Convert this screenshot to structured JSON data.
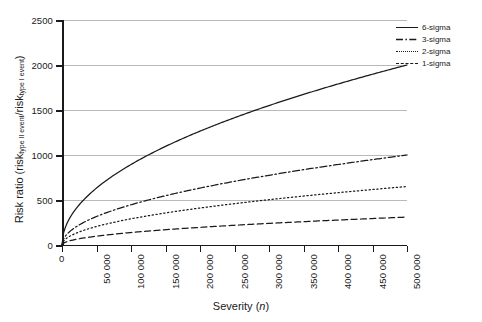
{
  "chart_data": {
    "type": "line",
    "title": "",
    "xlabel": "Severity (n)",
    "ylabel": "Risk ratio (risk_type II event / risk_type I event)",
    "ylabel_parts": {
      "prefix": "Risk ratio (risk",
      "sub1": "type II event",
      "mid": "/risk",
      "sub2": "type I event",
      "suffix": ")"
    },
    "xlabel_parts": {
      "prefix": "Severity (",
      "italic": "n",
      "suffix": ")"
    },
    "xlim": [
      0,
      500000
    ],
    "ylim": [
      0,
      2500
    ],
    "grid": true,
    "legend_position": "top-right",
    "xticks": [
      0,
      50000,
      100000,
      150000,
      200000,
      250000,
      300000,
      350000,
      400000,
      450000,
      500000
    ],
    "xticklabels": [
      "0",
      "50 000",
      "100 000",
      "150 000",
      "200 000",
      "250 000",
      "300 000",
      "350 000",
      "400 000",
      "450 000",
      "500 000"
    ],
    "yticks": [
      0,
      500,
      1000,
      1500,
      2000,
      2500
    ],
    "yticklabels": [
      "0",
      "500",
      "1000",
      "1500",
      "2000",
      "2500"
    ],
    "x": [
      0,
      5000,
      10000,
      20000,
      30000,
      50000,
      75000,
      100000,
      125000,
      150000,
      175000,
      200000,
      225000,
      250000,
      275000,
      300000,
      325000,
      350000,
      375000,
      400000,
      425000,
      450000,
      475000,
      500000
    ],
    "series": [
      {
        "name": "6-sigma",
        "style": "solid",
        "color": "#1a1a1a",
        "coefficient": 2.8284,
        "values": [
          0,
          200,
          283,
          400,
          490,
          632,
          775,
          894,
          1000,
          1095,
          1183,
          1265,
          1342,
          1414,
          1483,
          1549,
          1612,
          1673,
          1732,
          1789,
          1844,
          1897,
          1949,
          2000
        ]
      },
      {
        "name": "3-sigma",
        "style": "dashdot",
        "color": "#1a1a1a",
        "coefficient": 1.4142,
        "values": [
          0,
          100,
          141,
          200,
          245,
          316,
          387,
          447,
          500,
          548,
          592,
          632,
          671,
          707,
          742,
          775,
          806,
          837,
          866,
          894,
          922,
          949,
          975,
          1000
        ]
      },
      {
        "name": "2-sigma",
        "style": "dotted",
        "color": "#1a1a1a",
        "coefficient": 0.9192,
        "values": [
          0,
          65,
          92,
          130,
          159,
          206,
          252,
          291,
          325,
          356,
          385,
          411,
          436,
          460,
          482,
          504,
          524,
          544,
          563,
          581,
          599,
          617,
          634,
          650
        ]
      },
      {
        "name": "1-sigma",
        "style": "dashed",
        "color": "#1a1a1a",
        "coefficient": 0.4384,
        "values": [
          0,
          31,
          44,
          62,
          76,
          98,
          120,
          139,
          155,
          170,
          183,
          196,
          208,
          219,
          230,
          240,
          250,
          259,
          268,
          277,
          286,
          294,
          302,
          310
        ]
      }
    ],
    "legend": [
      {
        "label": "6-sigma",
        "style": "solid"
      },
      {
        "label": "3-sigma",
        "style": "dashdot"
      },
      {
        "label": "2-sigma",
        "style": "dotted"
      },
      {
        "label": "1-sigma",
        "style": "dashed"
      }
    ]
  }
}
